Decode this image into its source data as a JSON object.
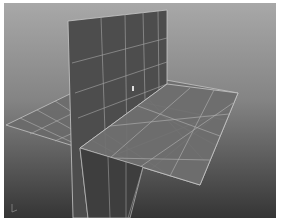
{
  "viewport": {
    "name": "3D perspective viewport",
    "background_top": "#a4a4a4",
    "background_bottom": "#3a3a3a",
    "grid_line_color": "#b8b8b8"
  },
  "objects": [
    {
      "name": "vertical-plane",
      "color": "#4e4e4e",
      "subdivisions_w": 4,
      "subdivisions_h": 4
    },
    {
      "name": "horizontal-plane",
      "color": "#6c6c6c",
      "subdivisions_w": 4,
      "subdivisions_h": 5
    }
  ],
  "axis_gizmo": {
    "label": "axis"
  }
}
